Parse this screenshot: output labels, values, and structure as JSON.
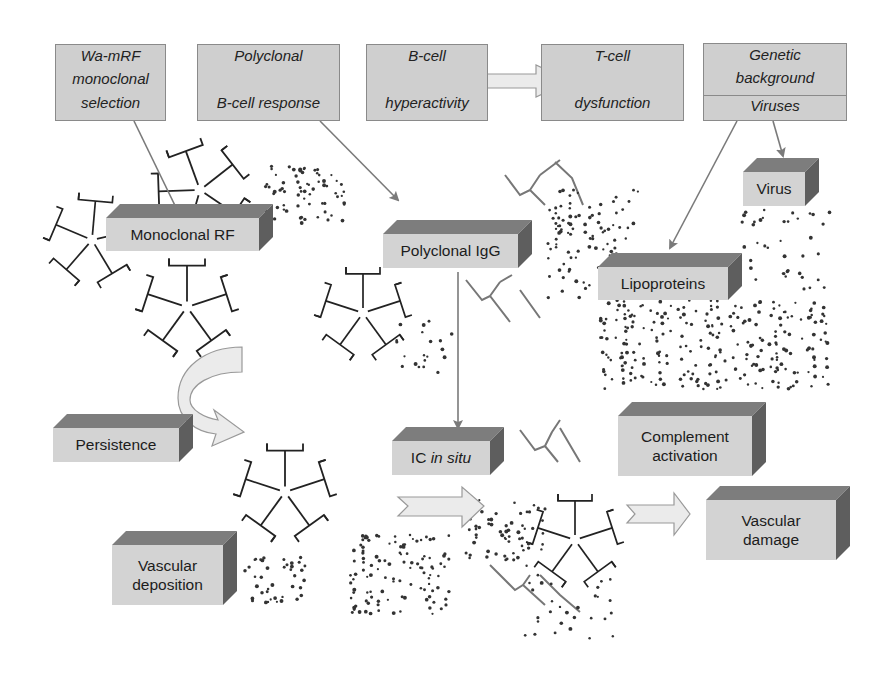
{
  "source_boxes": [
    {
      "id": "wa-mrf",
      "lines": [
        "Wa-mRF",
        "monoclonal",
        "selection"
      ]
    },
    {
      "id": "polyclonal-bcell",
      "lines": [
        "Polyclonal",
        "B-cell response"
      ]
    },
    {
      "id": "bcell-hyper",
      "lines": [
        "B-cell",
        "hyperactivity"
      ]
    },
    {
      "id": "tcell-dys",
      "lines": [
        "T-cell",
        "dysfunction"
      ]
    },
    {
      "id": "genetic",
      "lines": [
        "Genetic",
        "background"
      ],
      "sub": "Viruses"
    }
  ],
  "nodes": {
    "monoclonal_rf": "Monoclonal RF",
    "polyclonal_igg": "Polyclonal IgG",
    "virus": "Virus",
    "lipoproteins": "Lipoproteins",
    "persistence": "Persistence",
    "ic_in_situ_prefix": "IC ",
    "ic_in_situ_italic": "in situ",
    "complement_l1": "Complement",
    "complement_l2": "activation",
    "vascular_damage_l1": "Vascular",
    "vascular_damage_l2": "damage",
    "vascular_deposition_l1": "Vascular",
    "vascular_deposition_l2": "deposition"
  },
  "colors": {
    "box_face": "#d3d3d3",
    "box_top": "#7d7d7d",
    "box_side": "#5e5e5e",
    "flat_box": "#cfcfcf",
    "arrow_line": "#7a7a7a",
    "block_arrow_fill": "#ebebeb",
    "antibody_dark": "#222222",
    "antibody_gray": "#777777"
  }
}
